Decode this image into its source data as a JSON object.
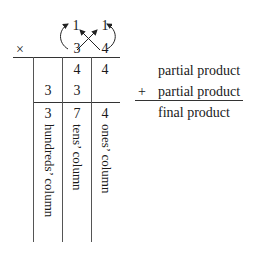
{
  "multiplication": {
    "operator": "×",
    "top_row": {
      "left": "1",
      "right": "1"
    },
    "bottom_row": {
      "left": "3",
      "right": "4"
    },
    "grid": {
      "row1": {
        "hundreds": "",
        "tens": "4",
        "ones": "4"
      },
      "row2": {
        "hundreds": "3",
        "tens": "3",
        "ones": ""
      },
      "final": {
        "hundreds": "3",
        "tens": "7",
        "ones": "4"
      }
    },
    "column_labels": {
      "hundreds": "hundreds’ column",
      "tens": "tens’ column",
      "ones": "ones’ column"
    }
  },
  "legend": {
    "partial_product_1": "partial product",
    "plus": "+",
    "partial_product_2": "partial product",
    "final_product": "final product"
  }
}
